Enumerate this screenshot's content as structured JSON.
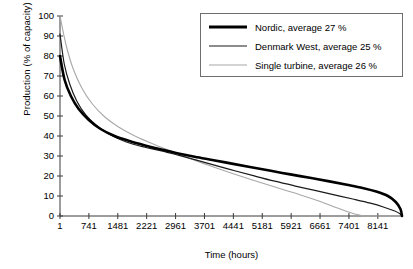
{
  "chart_data": {
    "type": "line",
    "title": "",
    "xlabel": "Time (hours)",
    "ylabel": "Production (% of capacity)",
    "xlim": [
      1,
      8760
    ],
    "ylim": [
      0,
      100
    ],
    "grid": false,
    "legend_position": "top-right",
    "xticks": [
      1,
      741,
      1481,
      2221,
      2961,
      3701,
      4441,
      5181,
      5921,
      6661,
      7401,
      8141
    ],
    "xtick_labels": [
      "1",
      "741",
      "1481",
      "2221",
      "2961",
      "3701",
      "4441",
      "5181",
      "5921",
      "6661",
      "7401",
      "8141"
    ],
    "yticks": [
      0,
      10,
      20,
      30,
      40,
      50,
      60,
      70,
      80,
      90,
      100
    ],
    "ytick_labels": [
      "0",
      "10",
      "20",
      "30",
      "40",
      "50",
      "60",
      "70",
      "80",
      "90",
      "100"
    ],
    "series": [
      {
        "name": "Nordic, average 27 %",
        "label": "Nordic, average 27 %",
        "color": "#000000",
        "width": 2.6,
        "x": [
          1,
          120,
          280,
          480,
          740,
          1040,
          1400,
          1780,
          2180,
          2600,
          3000,
          3450,
          3900,
          4400,
          4900,
          5400,
          5900,
          6400,
          6900,
          7350,
          7750,
          8100,
          8400,
          8600,
          8720,
          8760
        ],
        "y": [
          80,
          68,
          60,
          53.5,
          48,
          43.5,
          40,
          37.5,
          35.3,
          33.2,
          31.4,
          29.6,
          28,
          26.2,
          24.4,
          22.6,
          20.8,
          19.1,
          17.3,
          15.6,
          14,
          12.2,
          10,
          7,
          3.5,
          0
        ]
      },
      {
        "name": "Denmark West, average 25 %",
        "label": "Denmark West, average 25 %",
        "color": "#1a1a1a",
        "width": 1.2,
        "x": [
          1,
          110,
          250,
          430,
          660,
          950,
          1300,
          1700,
          2150,
          2600,
          3050,
          3520,
          4000,
          4500,
          5000,
          5500,
          6000,
          6500,
          7000,
          7500,
          7950,
          8300,
          8560,
          8700,
          8760
        ],
        "y": [
          91,
          76,
          66,
          57.5,
          50.5,
          45,
          40.5,
          37,
          34.5,
          32.6,
          30.3,
          27.8,
          25.2,
          22.5,
          19.9,
          17.4,
          15.1,
          12.9,
          10.7,
          8.5,
          6.4,
          4.4,
          2.6,
          1.2,
          0
        ]
      },
      {
        "name": "Single turbine, average 26 %",
        "label": "Single turbine, average 26 %",
        "color": "#a8a8a8",
        "width": 1.1,
        "x": [
          1,
          150,
          330,
          560,
          830,
          1150,
          1500,
          1880,
          2280,
          2680,
          3080,
          3500,
          3950,
          4400,
          4850,
          5300,
          5750,
          6200,
          6650,
          7050,
          7350,
          7550,
          7700,
          7850,
          8760
        ],
        "y": [
          100,
          86,
          74,
          64,
          56,
          49.5,
          44.5,
          40.4,
          36.9,
          33.7,
          30.6,
          27.5,
          24.4,
          21.4,
          18.5,
          15.7,
          13,
          10.3,
          7.4,
          4.4,
          2.2,
          1.0,
          0.4,
          0,
          0
        ]
      }
    ]
  },
  "legend": {
    "items": [
      {
        "label": "Nordic, average 27 %"
      },
      {
        "label": "Denmark West, average 25 %"
      },
      {
        "label": "Single turbine, average 26 %"
      }
    ]
  }
}
